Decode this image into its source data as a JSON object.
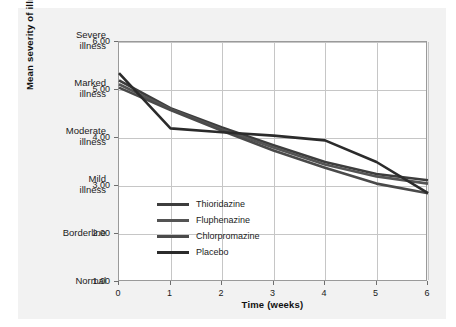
{
  "chart_data": {
    "type": "line",
    "title": "",
    "xlabel": "Time (weeks)",
    "ylabel": "Mean severity of illness scores",
    "xlim": [
      0,
      6
    ],
    "ylim": [
      1.0,
      6.0
    ],
    "grid": true,
    "legend_position": "inside-lower-left",
    "x": [
      0,
      1,
      2,
      3,
      4,
      5,
      6
    ],
    "xticklabels": [
      "0",
      "1",
      "2",
      "3",
      "4",
      "5",
      "6"
    ],
    "yticklabels": [
      "1.00",
      "2.00",
      "3.00",
      "4.00",
      "5.00",
      "6.00"
    ],
    "ytickvalues": [
      1.0,
      2.0,
      3.0,
      4.0,
      5.0,
      6.0
    ],
    "ycategorylabels": [
      "Normal",
      "Borderline",
      "Mild illness",
      "Moderate illness",
      "Marked illness",
      "Severe illness"
    ],
    "series": [
      {
        "name": "Thioridazine",
        "color": "#3d3d3d",
        "values": [
          5.2,
          4.62,
          4.22,
          3.85,
          3.5,
          3.25,
          3.12
        ]
      },
      {
        "name": "Fluphenazine",
        "color": "#545454",
        "values": [
          5.12,
          4.6,
          4.18,
          3.8,
          3.45,
          3.2,
          3.05
        ]
      },
      {
        "name": "Chlorpromazine",
        "color": "#4a4a4a",
        "values": [
          5.05,
          4.58,
          4.15,
          3.74,
          3.38,
          3.05,
          2.85
        ]
      },
      {
        "name": "Placebo",
        "color": "#2b2b2b",
        "values": [
          5.35,
          4.2,
          4.12,
          4.05,
          3.95,
          3.5,
          2.85
        ]
      }
    ]
  },
  "legend": {
    "items": [
      {
        "label": "Thioridazine",
        "color": "#3d3d3d"
      },
      {
        "label": "Fluphenazine",
        "color": "#545454"
      },
      {
        "label": "Chlorpromazine",
        "color": "#4a4a4a"
      },
      {
        "label": "Placebo",
        "color": "#2b2b2b"
      }
    ]
  },
  "axes": {
    "x_title": "Time (weeks)",
    "y_title": "Mean severity of illness scores"
  },
  "colors": {
    "panel_bg": "#f2f2f2",
    "plot_bg": "#ffffff",
    "grid": "#c6c6c6",
    "border": "#9a9a9a",
    "text": "#1b1b1b"
  }
}
